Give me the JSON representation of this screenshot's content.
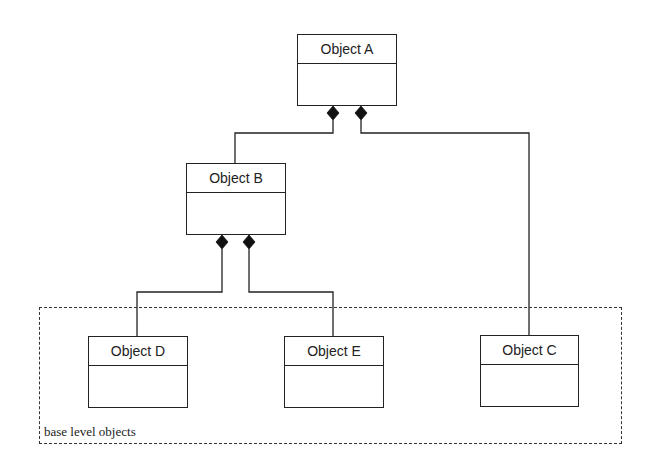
{
  "diagram": {
    "type": "UML composition hierarchy",
    "objects": [
      {
        "id": "A",
        "label": "Object A"
      },
      {
        "id": "B",
        "label": "Object B"
      },
      {
        "id": "C",
        "label": "Object C"
      },
      {
        "id": "D",
        "label": "Object D"
      },
      {
        "id": "E",
        "label": "Object E"
      }
    ],
    "relations": [
      {
        "from": "A",
        "to": "B",
        "kind": "composition"
      },
      {
        "from": "A",
        "to": "C",
        "kind": "composition"
      },
      {
        "from": "B",
        "to": "D",
        "kind": "composition"
      },
      {
        "from": "B",
        "to": "E",
        "kind": "composition"
      }
    ],
    "group": {
      "label": "base level objects",
      "members": [
        "D",
        "E",
        "C"
      ]
    }
  },
  "colors": {
    "line": "#222222",
    "background": "#ffffff"
  }
}
